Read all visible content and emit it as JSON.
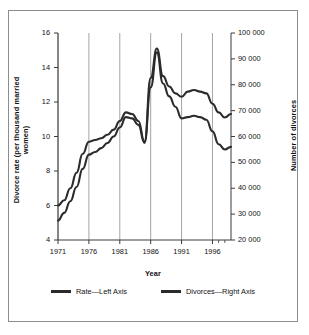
{
  "chart_data": {
    "type": "line",
    "title": "",
    "xlabel": "Year",
    "ylabel": "Divorce rate (per thousand married women)",
    "y2label": "Number of divorces",
    "xlim": [
      1971,
      1999
    ],
    "ylim": [
      4,
      16
    ],
    "y2lim": [
      20000,
      100000
    ],
    "grid": "vertical-major",
    "legend_position": "bottom",
    "x_ticks": [
      "1971",
      "1976",
      "1981",
      "1986",
      "1991",
      "1996"
    ],
    "x_tick_values": [
      1971,
      1976,
      1981,
      1986,
      1991,
      1996
    ],
    "y_ticks": [
      "4",
      "6",
      "8",
      "10",
      "12",
      "14",
      "16"
    ],
    "y_tick_values": [
      4,
      6,
      8,
      10,
      12,
      14,
      16
    ],
    "y2_ticks": [
      "20 000",
      "30 000",
      "40 000",
      "50 000",
      "60 000",
      "70 000",
      "80 000",
      "90 000",
      "100 000"
    ],
    "y2_tick_values": [
      20000,
      30000,
      40000,
      50000,
      60000,
      70000,
      80000,
      90000,
      100000
    ],
    "x": [
      1971,
      1972,
      1973,
      1974,
      1975,
      1976,
      1977,
      1978,
      1979,
      1980,
      1981,
      1982,
      1983,
      1984,
      1985,
      1986,
      1987,
      1988,
      1989,
      1990,
      1991,
      1992,
      1993,
      1994,
      1995,
      1996,
      1997,
      1998,
      1999
    ],
    "series": [
      {
        "name": "Rate—Left Axis",
        "axis": "left",
        "color": "#2b2b2b",
        "values": [
          6.0,
          6.3,
          7.0,
          7.9,
          9.0,
          9.7,
          9.8,
          9.9,
          10.1,
          10.4,
          10.9,
          11.4,
          11.3,
          10.9,
          9.7,
          13.4,
          15.1,
          13.5,
          12.9,
          12.5,
          12.3,
          12.6,
          12.7,
          12.6,
          12.5,
          11.9,
          11.4,
          11.1,
          11.3
        ]
      },
      {
        "name": "Divorces—Right Axis",
        "axis": "right",
        "color": "#2b2b2b",
        "values": [
          27500,
          30500,
          35000,
          40500,
          47500,
          53000,
          54000,
          55500,
          57500,
          60000,
          63500,
          67500,
          67000,
          64500,
          57500,
          79000,
          92500,
          80500,
          75500,
          71500,
          67000,
          67500,
          68000,
          67500,
          66500,
          62000,
          57000,
          55000,
          56000
        ]
      }
    ]
  },
  "legend": {
    "entries": [
      {
        "label": "Rate—Left Axis"
      },
      {
        "label": "Divorces—Right Axis"
      }
    ]
  }
}
